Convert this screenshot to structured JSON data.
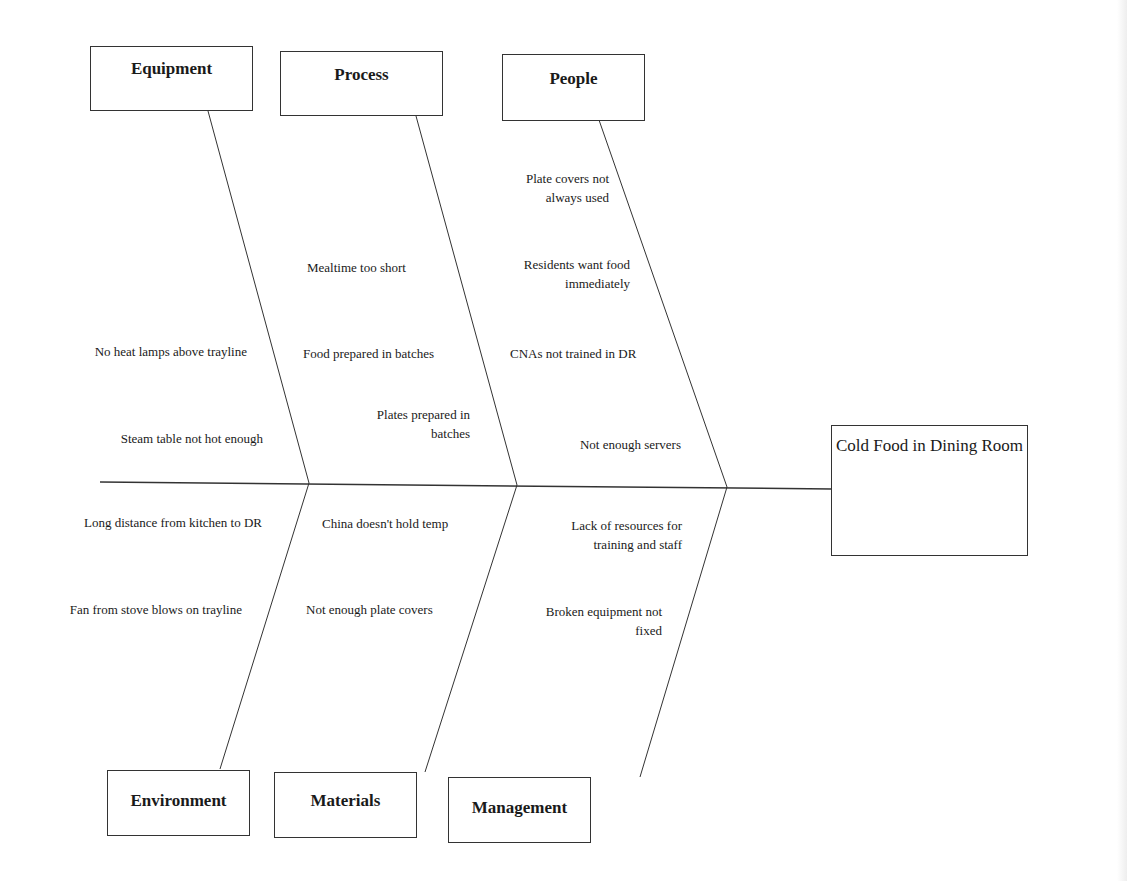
{
  "effect": {
    "label": "Cold Food in Dining Room"
  },
  "categories": {
    "equipment": {
      "label": "Equipment"
    },
    "process": {
      "label": "Process"
    },
    "people": {
      "label": "People"
    },
    "environment": {
      "label": "Environment"
    },
    "materials": {
      "label": "Materials"
    },
    "management": {
      "label": "Management"
    }
  },
  "causes": {
    "equipment": [
      "No heat lamps above trayline",
      "Steam table not hot enough"
    ],
    "process": [
      "Mealtime too short",
      "Food prepared in batches",
      "Plates prepared in\nbatches"
    ],
    "people": [
      "Plate covers not\nalways used",
      "Residents want food\nimmediately",
      "CNAs not trained in DR",
      "Not enough servers"
    ],
    "environment": [
      "Long distance from kitchen to DR",
      "Fan from stove blows on trayline"
    ],
    "materials": [
      "China doesn't hold temp",
      "Not enough plate covers"
    ],
    "management": [
      "Lack of resources for\ntraining and staff",
      "Broken equipment not\nfixed"
    ]
  },
  "colors": {
    "line": "#333333",
    "text": "#1a1a1a",
    "background": "#ffffff"
  }
}
